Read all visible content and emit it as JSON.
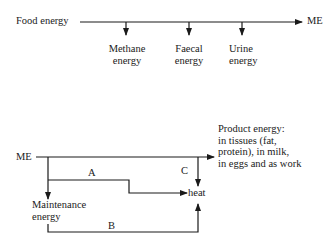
{
  "top_flow": {
    "source_label": "Food energy",
    "target_label": "ME",
    "losses": [
      {
        "line1": "Methane",
        "line2": "energy"
      },
      {
        "line1": "Faecal",
        "line2": "energy"
      },
      {
        "line1": "Urine",
        "line2": "energy"
      }
    ]
  },
  "bottom_flow": {
    "source_label": "ME",
    "product": {
      "line1": "Product energy:",
      "line2": "in tissues (fat,",
      "line3": "protein), in milk,",
      "line4": "in eggs and as work"
    },
    "maintenance": {
      "line1": "Maintenance",
      "line2": "energy"
    },
    "heat_label": "heat",
    "path_labels": {
      "a": "A",
      "b": "B",
      "c": "C"
    }
  },
  "colors": {
    "line": "#1a1a1a",
    "background": "#ffffff"
  }
}
